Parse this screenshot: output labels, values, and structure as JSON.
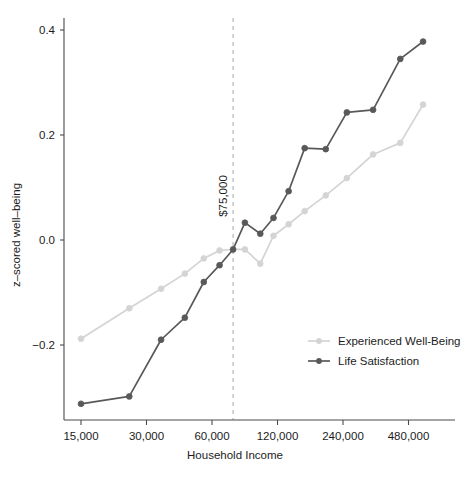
{
  "chart_data": {
    "type": "line",
    "title": "",
    "xlabel": "Household Income",
    "ylabel": "z–scored well–being",
    "x_scale": "log2",
    "xticks": [
      15000,
      30000,
      60000,
      120000,
      240000,
      480000
    ],
    "xtick_labels": [
      "15,000",
      "30,000",
      "60,000",
      "120,000",
      "240,000",
      "480,000"
    ],
    "yticks": [
      0.4,
      0.2,
      0.0,
      -0.2
    ],
    "ytick_labels": [
      "0.4",
      "0.2",
      "0.0",
      "−0.2"
    ],
    "ylim": [
      -0.35,
      0.43
    ],
    "xlim": [
      13000,
      620000
    ],
    "grid": false,
    "legend_position": "bottom-right",
    "annotations": [
      {
        "name": "reference-line",
        "label": "$75,000",
        "x": 75000,
        "orientation": "vertical",
        "style": "dashed",
        "color": "#bdbdbd"
      }
    ],
    "series": [
      {
        "name": "Experienced Well-Being",
        "color": "#d4d4d4",
        "marker": "circle",
        "x": [
          15000,
          25000,
          35000,
          45000,
          55000,
          65000,
          75000,
          85000,
          100000,
          115000,
          135000,
          160000,
          200000,
          250000,
          330000,
          440000,
          560000
        ],
        "values": [
          -0.188,
          -0.13,
          -0.093,
          -0.064,
          -0.035,
          -0.02,
          -0.018,
          -0.018,
          -0.045,
          0.008,
          0.03,
          0.055,
          0.085,
          0.118,
          0.163,
          0.185,
          0.258
        ]
      },
      {
        "name": "Life Satisfaction",
        "color": "#595959",
        "marker": "circle",
        "x": [
          15000,
          25000,
          35000,
          45000,
          55000,
          65000,
          75000,
          85000,
          100000,
          115000,
          135000,
          160000,
          200000,
          250000,
          330000,
          440000,
          560000
        ],
        "values": [
          -0.312,
          -0.298,
          -0.19,
          -0.148,
          -0.08,
          -0.048,
          -0.018,
          0.033,
          0.012,
          0.042,
          0.093,
          0.175,
          0.173,
          0.243,
          0.248,
          0.345,
          0.378
        ]
      }
    ]
  },
  "legend": {
    "items": [
      {
        "label": "Experienced Well-Being",
        "color": "#d4d4d4"
      },
      {
        "label": "Life Satisfaction",
        "color": "#595959"
      }
    ]
  },
  "axes": {
    "x_title": "Household Income",
    "y_title": "z–scored well–being"
  },
  "reference": {
    "label": "$75,000"
  }
}
